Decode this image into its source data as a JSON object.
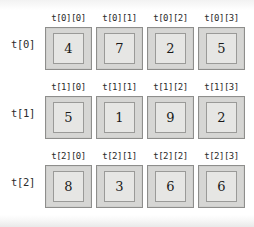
{
  "figure": {
    "colors": {
      "page_background": "#ffffff",
      "box_outer_fill": "#d6d6d4",
      "box_outer_border": "#8e8e8c",
      "box_inner_fill": "#e6e6e4",
      "box_inner_border": "#9a9a98",
      "text": "#1a1a1a"
    },
    "rows": [
      {
        "row_label": "t[0]",
        "cells": [
          {
            "header": "t[0][0]",
            "value": "4"
          },
          {
            "header": "t[0][1]",
            "value": "7"
          },
          {
            "header": "t[0][2]",
            "value": "2"
          },
          {
            "header": "t[0][3]",
            "value": "5"
          }
        ]
      },
      {
        "row_label": "t[1]",
        "cells": [
          {
            "header": "t[1][0]",
            "value": "5"
          },
          {
            "header": "t[1][1]",
            "value": "1"
          },
          {
            "header": "t[1][2]",
            "value": "9"
          },
          {
            "header": "t[1][3]",
            "value": "2"
          }
        ]
      },
      {
        "row_label": "t[2]",
        "cells": [
          {
            "header": "t[2][0]",
            "value": "8"
          },
          {
            "header": "t[2][1]",
            "value": "3"
          },
          {
            "header": "t[2][2]",
            "value": "6"
          },
          {
            "header": "t[2][3]",
            "value": "6"
          }
        ]
      }
    ]
  }
}
